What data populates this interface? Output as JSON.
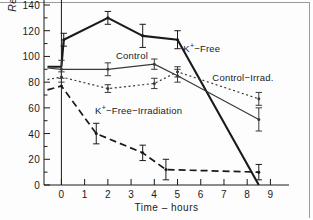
{
  "figure": {
    "axis_color": "#1a1a1a",
    "background": "#fdfdfd"
  },
  "axes": {
    "ylabel": "Resting Potential – mV",
    "xlabel": "Time – hours",
    "yticks": [
      "0",
      "20",
      "40",
      "60",
      "80",
      "100",
      "120",
      "140"
    ],
    "xticks": [
      "0",
      "1",
      "2",
      "3",
      "4",
      "5",
      "6",
      "7",
      "8",
      "9"
    ]
  },
  "annotations": {
    "k_free": {
      "text_pre": "K",
      "sup": "+",
      "text_post": "−Free"
    },
    "control": {
      "text": "Control"
    },
    "control_irrad": {
      "text": "Control−Irrad."
    },
    "k_free_irrad": {
      "text_pre": "K",
      "sup": "+",
      "text_post": "−Free−Irradiation"
    }
  },
  "chart_data": {
    "type": "line",
    "title": "",
    "xlabel": "Time – hours",
    "ylabel": "Resting Potential – mV",
    "xlim": [
      -0.75,
      9.8
    ],
    "ylim": [
      0,
      140
    ],
    "xticks": [
      0,
      1,
      2,
      3,
      4,
      5,
      6,
      7,
      8,
      9
    ],
    "yticks": [
      0,
      20,
      40,
      60,
      80,
      100,
      120,
      140
    ],
    "grid": false,
    "legend": "inline-annotations",
    "series": [
      {
        "name": "K+-Free",
        "style": "solid-thick",
        "color": "#1a1a1a",
        "x": [
          -0.6,
          0.0,
          0.1,
          2.0,
          3.5,
          5.0,
          8.5
        ],
        "y": [
          92,
          92,
          113,
          130,
          116,
          113,
          0
        ],
        "errors": [
          0,
          0,
          5,
          5,
          9,
          7,
          0
        ],
        "markers_at": [
          0.1,
          2.0,
          3.5,
          5.0
        ]
      },
      {
        "name": "Control",
        "style": "solid-thin",
        "color": "#3a3a3a",
        "x": [
          -0.6,
          0.0,
          2.0,
          4.0,
          5.0,
          8.5
        ],
        "y": [
          91,
          90,
          90,
          94,
          85,
          51
        ],
        "errors": [
          0,
          7,
          5,
          4,
          5,
          9
        ],
        "markers_at": [
          0.0,
          2.0,
          4.0,
          5.0,
          8.5
        ]
      },
      {
        "name": "Control-Irrad.",
        "style": "dotted",
        "color": "#3a3a3a",
        "x": [
          -0.6,
          0.0,
          2.0,
          4.0,
          5.0,
          8.5
        ],
        "y": [
          82,
          84,
          75,
          79,
          88,
          67
        ],
        "errors": [
          0,
          4,
          3,
          4,
          4,
          5
        ],
        "markers_at": [
          0.0,
          2.0,
          4.0,
          5.0,
          8.5
        ]
      },
      {
        "name": "K+-Free-Irradiation",
        "style": "dashed",
        "color": "#1a1a1a",
        "x": [
          -0.6,
          0.0,
          1.5,
          3.5,
          4.5,
          8.5
        ],
        "y": [
          74,
          77,
          40,
          25,
          12,
          10
        ],
        "errors": [
          0,
          0,
          8,
          6,
          8,
          6
        ],
        "markers_at": [
          0.0,
          1.5,
          3.5,
          4.5,
          8.5
        ]
      }
    ]
  }
}
